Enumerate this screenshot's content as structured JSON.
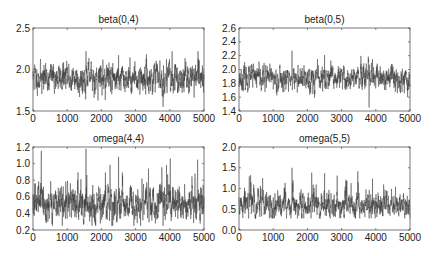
{
  "chart_data": [
    {
      "type": "line",
      "title": "beta(0,4)",
      "xlabel": "",
      "ylabel": "",
      "xlim": [
        0,
        5000
      ],
      "ylim": [
        1.5,
        2.5
      ],
      "xticks": [
        0,
        1000,
        2000,
        3000,
        4000,
        5000
      ],
      "yticks": [
        "1.5",
        "2.0",
        "2.5"
      ],
      "ytick_values": [
        1.5,
        2.0,
        2.5
      ],
      "series": [
        {
          "name": "beta(0,4) trace",
          "n": 5000,
          "mean": 1.9,
          "sd": 0.09,
          "min": 1.55,
          "max": 2.22
        }
      ],
      "grid": false,
      "legend": null
    },
    {
      "type": "line",
      "title": "beta(0,5)",
      "xlabel": "",
      "ylabel": "",
      "xlim": [
        0,
        5000
      ],
      "ylim": [
        1.4,
        2.6
      ],
      "xticks": [
        0,
        1000,
        2000,
        3000,
        4000,
        5000
      ],
      "yticks": [
        "1.4",
        "1.6",
        "1.8",
        "2.0",
        "2.2",
        "2.4",
        "2.6"
      ],
      "ytick_values": [
        1.4,
        1.6,
        1.8,
        2.0,
        2.2,
        2.4,
        2.6
      ],
      "series": [
        {
          "name": "beta(0,5) trace",
          "n": 5000,
          "mean": 1.87,
          "sd": 0.09,
          "min": 1.45,
          "max": 2.27
        }
      ],
      "grid": false,
      "legend": null
    },
    {
      "type": "line",
      "title": "omega(4,4)",
      "xlabel": "",
      "ylabel": "",
      "xlim": [
        0,
        5000
      ],
      "ylim": [
        0.2,
        1.2
      ],
      "xticks": [
        0,
        1000,
        2000,
        3000,
        4000,
        5000
      ],
      "yticks": [
        "0.2",
        "0.4",
        "0.6",
        "0.8",
        "1.0",
        "1.2"
      ],
      "ytick_values": [
        0.2,
        0.4,
        0.6,
        0.8,
        1.0,
        1.2
      ],
      "series": [
        {
          "name": "omega(4,4) trace",
          "n": 5000,
          "mean": 0.52,
          "sd": 0.11,
          "min": 0.25,
          "max": 1.18
        }
      ],
      "grid": false,
      "legend": null
    },
    {
      "type": "line",
      "title": "omega(5,5)",
      "xlabel": "",
      "ylabel": "",
      "xlim": [
        0,
        5000
      ],
      "ylim": [
        0.0,
        2.0
      ],
      "xticks": [
        0,
        1000,
        2000,
        3000,
        4000,
        5000
      ],
      "yticks": [
        "0.0",
        "0.5",
        "1.0",
        "1.5",
        "2.0"
      ],
      "ytick_values": [
        0.0,
        0.5,
        1.0,
        1.5,
        2.0
      ],
      "series": [
        {
          "name": "omega(5,5) trace",
          "n": 5000,
          "mean": 0.62,
          "sd": 0.16,
          "min": 0.28,
          "max": 1.5
        }
      ],
      "grid": false,
      "legend": null
    }
  ],
  "panels": [
    {
      "title": "beta(0,4)",
      "box": [
        33,
        28,
        171,
        83
      ],
      "seed": 11,
      "skew": 0.0
    },
    {
      "title": "beta(0,5)",
      "box": [
        239,
        28,
        171,
        83
      ],
      "seed": 23,
      "skew": 0.0
    },
    {
      "title": "omega(4,4)",
      "box": [
        33,
        147,
        171,
        83
      ],
      "seed": 37,
      "skew": 1.0
    },
    {
      "title": "omega(5,5)",
      "box": [
        239,
        147,
        171,
        83
      ],
      "seed": 51,
      "skew": 1.0
    }
  ],
  "colors": {
    "trace": "#3a3a3a",
    "axis": "#555555",
    "text": "#222222"
  }
}
